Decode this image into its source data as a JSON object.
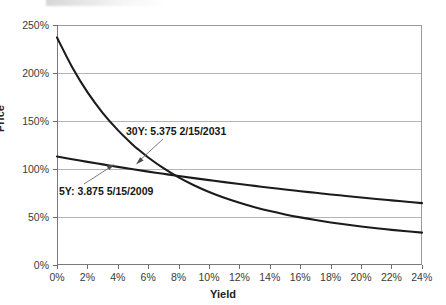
{
  "chart_data": {
    "type": "line",
    "title": "",
    "xlabel": "Yield",
    "ylabel": "Price",
    "xlim": [
      0,
      24
    ],
    "ylim": [
      0,
      250
    ],
    "grid": true,
    "legend": "none (inline annotations)",
    "x_tick_labels": [
      "0%",
      "2%",
      "4%",
      "6%",
      "8%",
      "10%",
      "12%",
      "14%",
      "16%",
      "18%",
      "20%",
      "22%",
      "24%"
    ],
    "x_tick_values": [
      0,
      2,
      4,
      6,
      8,
      10,
      12,
      14,
      16,
      18,
      20,
      22,
      24
    ],
    "y_tick_labels": [
      "0%",
      "50%",
      "100%",
      "150%",
      "200%",
      "250%"
    ],
    "y_tick_values": [
      0,
      50,
      100,
      150,
      200,
      250
    ],
    "series": [
      {
        "name": "30Y: 5.375 2/15/2031",
        "x": [
          0,
          1,
          2,
          3,
          4,
          5,
          5.375,
          6,
          7,
          8,
          9,
          10,
          11,
          12,
          13,
          14,
          15,
          16,
          17,
          18,
          19,
          20,
          21,
          22,
          23,
          24
        ],
        "values": [
          237.0,
          206.0,
          180.0,
          158.5,
          140.5,
          125.0,
          120.0,
          112.0,
          100.8,
          91.2,
          83.0,
          76.0,
          70.0,
          64.8,
          60.2,
          56.2,
          52.7,
          49.6,
          46.8,
          44.3,
          42.1,
          40.1,
          38.3,
          36.6,
          35.1,
          33.7
        ]
      },
      {
        "name": "5Y: 3.875 5/15/2009",
        "x": [
          0,
          1,
          2,
          3,
          4,
          5,
          6,
          7,
          8,
          9,
          10,
          11,
          12,
          13,
          14,
          15,
          16,
          17,
          18,
          19,
          20,
          21,
          22,
          23,
          24
        ],
        "values": [
          113.0,
          110.2,
          107.4,
          104.8,
          102.2,
          99.7,
          97.3,
          95.0,
          92.7,
          90.5,
          88.4,
          86.3,
          84.3,
          82.4,
          80.5,
          78.7,
          76.9,
          75.2,
          73.5,
          71.9,
          70.3,
          68.8,
          67.3,
          65.9,
          64.5
        ]
      }
    ],
    "annotations": [
      {
        "name": "30Y",
        "text": "30Y: 5.375 2/15/2031",
        "points_to": "30Y curve near 6% yield"
      },
      {
        "name": "5Y",
        "text": "5Y: 3.875 5/15/2009",
        "points_to": "5Y curve near 4% yield"
      }
    ],
    "colors": {
      "curve": "#1b1b1b",
      "gridline": "#b4b4b4",
      "axis": "#7a7a7a",
      "text": "#222222"
    }
  }
}
